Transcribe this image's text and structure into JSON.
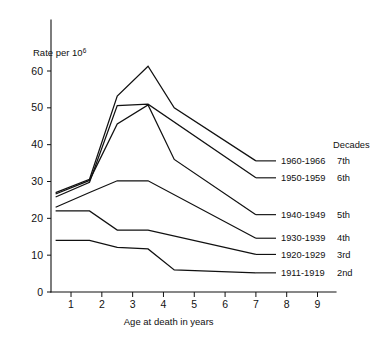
{
  "chart_data": {
    "type": "line",
    "title": "",
    "subtitle": "",
    "xlabel": "Age at death in years",
    "ylabel": "Rate per 10",
    "ylabel_exponent": "6",
    "ylabel_full": "Rate per 10^6",
    "legend_header": "Decades",
    "legend_position": "right",
    "grid": false,
    "xlim": [
      0.35,
      9.6
    ],
    "ylim": [
      0,
      66
    ],
    "xticks": [
      1,
      2,
      3,
      4,
      5,
      6,
      7,
      8,
      9
    ],
    "xtick_labels": [
      "1",
      "2",
      "3",
      "4",
      "5",
      "6",
      "7",
      "8",
      "9"
    ],
    "yticks": [
      0,
      10,
      20,
      30,
      40,
      50,
      60
    ],
    "ytick_labels": [
      "0",
      "10",
      "20",
      "30",
      "40",
      "50",
      "60"
    ],
    "series": [
      {
        "name": "1960-1966",
        "ordinal": "7th",
        "label": "1960-1966",
        "x": [
          0.5,
          1.6,
          2.5,
          3.5,
          4.35,
          7.0
        ],
        "values": [
          27.0,
          30.5,
          53.0,
          61.3,
          50.0,
          35.5
        ],
        "label_y": 35.5
      },
      {
        "name": "1950-1959",
        "ordinal": "6th",
        "label": "1950-1959",
        "x": [
          0.5,
          1.6,
          2.5,
          3.5,
          7.0
        ],
        "values": [
          25.8,
          30.0,
          50.5,
          51.0,
          31.0
        ],
        "label_y": 31.0
      },
      {
        "name": "1940-1949",
        "ordinal": "5th",
        "label": "1940-1949",
        "x": [
          0.5,
          1.6,
          2.5,
          3.5,
          4.35,
          7.0
        ],
        "values": [
          26.5,
          30.2,
          45.5,
          50.8,
          36.0,
          21.0
        ],
        "label_y": 21.0
      },
      {
        "name": "1930-1939",
        "ordinal": "4th",
        "label": "1930-1939",
        "x": [
          0.5,
          1.6,
          2.5,
          3.5,
          7.0
        ],
        "values": [
          23.0,
          27.0,
          30.2,
          30.2,
          14.5
        ],
        "label_y": 14.5
      },
      {
        "name": "1920-1929",
        "ordinal": "3rd",
        "label": "1920-1929",
        "x": [
          0.5,
          1.6,
          2.5,
          3.5,
          7.0
        ],
        "values": [
          22.0,
          22.0,
          16.8,
          16.8,
          10.2
        ],
        "label_y": 10.2
      },
      {
        "name": "1911-1919",
        "ordinal": "2nd",
        "label": "1911-1919",
        "x": [
          0.5,
          1.6,
          2.5,
          3.5,
          4.35,
          7.0
        ],
        "values": [
          14.0,
          14.0,
          12.0,
          11.7,
          6.0,
          5.2
        ],
        "label_y": 5.2
      }
    ],
    "series_paths": [
      {
        "name": "1960-1966",
        "points": [
          [
            0.5,
            27.0
          ],
          [
            1.6,
            30.6
          ],
          [
            2.5,
            53.2
          ],
          [
            3.5,
            61.3
          ],
          [
            4.35,
            50.0
          ],
          [
            7.0,
            35.6
          ]
        ]
      },
      {
        "name": "1950-1959",
        "points": [
          [
            0.5,
            25.8
          ],
          [
            1.6,
            29.8
          ],
          [
            2.5,
            50.6
          ],
          [
            3.5,
            51.0
          ],
          [
            7.0,
            31.0
          ]
        ]
      },
      {
        "name": "1940-1949",
        "points": [
          [
            0.5,
            26.6
          ],
          [
            1.6,
            30.3
          ],
          [
            2.5,
            45.6
          ],
          [
            3.5,
            50.8
          ],
          [
            4.35,
            36.0
          ],
          [
            7.0,
            21.0
          ]
        ]
      },
      {
        "name": "1930-1939",
        "points": [
          [
            0.5,
            23.0
          ],
          [
            1.6,
            27.0
          ],
          [
            2.5,
            30.2
          ],
          [
            3.5,
            30.2
          ],
          [
            7.0,
            14.6
          ]
        ]
      },
      {
        "name": "1920-1929",
        "points": [
          [
            0.5,
            22.0
          ],
          [
            1.6,
            22.0
          ],
          [
            2.5,
            16.8
          ],
          [
            3.5,
            16.8
          ],
          [
            7.0,
            10.2
          ]
        ]
      },
      {
        "name": "1911-1919",
        "points": [
          [
            0.5,
            14.0
          ],
          [
            1.6,
            14.0
          ],
          [
            2.5,
            12.1
          ],
          [
            3.5,
            11.7
          ],
          [
            4.35,
            6.0
          ],
          [
            7.0,
            5.2
          ]
        ]
      }
    ],
    "note": "Series ordered top to bottom at right edge: 7th, 6th, 5th, 4th, 3rd, 2nd decades"
  },
  "legend": {
    "header": "Decades",
    "entries": [
      {
        "label": "1960-1966",
        "ordinal": "7th"
      },
      {
        "label": "1950-1959",
        "ordinal": "6th"
      },
      {
        "label": "1940-1949",
        "ordinal": "5th"
      },
      {
        "label": "1930-1939",
        "ordinal": "4th"
      },
      {
        "label": "1920-1929",
        "ordinal": "3rd"
      },
      {
        "label": "1911-1919",
        "ordinal": "2nd"
      }
    ]
  }
}
